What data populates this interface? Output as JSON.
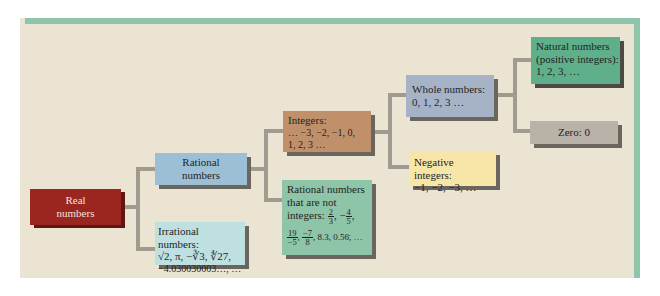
{
  "diagram": {
    "type": "tree",
    "colors": {
      "frame": "#8fc6a9",
      "background": "#ece4d3",
      "connector": "#a09a91",
      "real": "#9b2620",
      "rational": "#9dbfd6",
      "irrational": "#bfe0e0",
      "integers": "#c0906a",
      "non_integer_rationals": "#8ec5a8",
      "whole": "#a6b3c6",
      "negative": "#f7e6a7",
      "natural": "#5eaf8a",
      "zero": "#b8b2a8"
    },
    "nodes": {
      "real": {
        "line1": "Real",
        "line2": "numbers"
      },
      "rational": {
        "line1": "Rational",
        "line2": "numbers"
      },
      "irrational": {
        "title": "Irrational numbers:",
        "line2": "√2, π, −∛3, ∜27,",
        "line3": "−4.030030003…, …"
      },
      "integers": {
        "title": "Integers:",
        "line2": "… −3, −2, −1, 0,",
        "line3": "1, 2, 3 …"
      },
      "non_integer_rationals": {
        "line1": "Rational numbers",
        "line2": "that are not",
        "line3_label": "integers:",
        "frac1_num": "2",
        "frac1_den": "3",
        "sep1": ", −",
        "frac2_num": "4",
        "frac2_den": "5",
        "sep2": ",",
        "frac3_num": "19",
        "frac3_den": "−5",
        "sep3": ",",
        "frac4_num": "−7",
        "frac4_den": "8",
        "tail": ", 8.3, 0.56̄, …"
      },
      "whole": {
        "title": "Whole numbers:",
        "line2": "0, 1, 2, 3 …"
      },
      "negative": {
        "title": "Negative integers:",
        "line2": "−1, −2, −3, …"
      },
      "natural": {
        "line1": "Natural numbers",
        "line2": "(positive integers):",
        "line3": "1, 2, 3, …"
      },
      "zero": {
        "label": "Zero: 0"
      }
    },
    "edges": [
      [
        "real",
        "rational"
      ],
      [
        "real",
        "irrational"
      ],
      [
        "rational",
        "integers"
      ],
      [
        "rational",
        "non_integer_rationals"
      ],
      [
        "integers",
        "whole"
      ],
      [
        "integers",
        "negative"
      ],
      [
        "whole",
        "natural"
      ],
      [
        "whole",
        "zero"
      ]
    ]
  }
}
